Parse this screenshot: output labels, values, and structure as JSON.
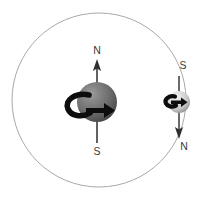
{
  "diagram": {
    "background_color": "#ffffff",
    "orbit": {
      "name": "orbit-circle",
      "center_x": 99,
      "center_y": 100,
      "radius": 87,
      "stroke_color": "#a9a9a9",
      "stroke_width": 1
    },
    "bodies": [
      {
        "id": "planet",
        "name": "large-sphere",
        "center_x": 97,
        "center_y": 102,
        "radius": 20,
        "fill_color": "#6e6e6e",
        "highlight_color": "#9a9a9a",
        "shadow_color": "#3d3d3d",
        "axis": {
          "name": "planet-magnetic-axis",
          "color": "#3a3a3a",
          "top_y": 60,
          "bottom_y": 144,
          "arrow_direction": "up"
        },
        "spin_arrow": {
          "name": "planet-spin-arrow",
          "direction": "clockwise-viewed-from-north",
          "color": "#111111"
        },
        "labels": {
          "top": "N",
          "bottom": "S"
        },
        "label_positions": {
          "top_x": 97,
          "top_y": 51,
          "bottom_x": 97,
          "bottom_y": 152
        }
      },
      {
        "id": "moon",
        "name": "small-sphere",
        "center_x": 179,
        "center_y": 102,
        "radius": 11,
        "fill_color": "#d4d4d4",
        "highlight_color": "#f2f2f2",
        "shadow_color": "#8d8d8d",
        "axis": {
          "name": "moon-magnetic-axis",
          "color": "#3a3a3a",
          "top_y": 74,
          "bottom_y": 138,
          "arrow_direction": "down"
        },
        "spin_arrow": {
          "name": "moon-spin-arrow",
          "direction": "clockwise-viewed-from-north",
          "color": "#111111"
        },
        "labels": {
          "top": "S",
          "bottom": "N"
        },
        "label_positions": {
          "top_x": 183,
          "top_y": 66,
          "bottom_x": 184,
          "bottom_y": 147
        }
      }
    ]
  }
}
